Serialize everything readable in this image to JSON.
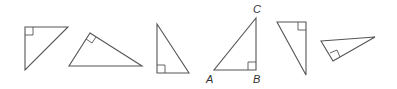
{
  "figure": {
    "triangles": [
      {
        "id": "triangle-1",
        "orientation": "right angle top-left",
        "labels": []
      },
      {
        "id": "triangle-2",
        "orientation": "right angle at apex, hypotenuse on bottom",
        "labels": []
      },
      {
        "id": "triangle-3",
        "orientation": "right angle bottom-left",
        "labels": []
      },
      {
        "id": "triangle-4",
        "orientation": "right angle bottom-right",
        "labels": [
          "A",
          "B",
          "C"
        ]
      },
      {
        "id": "triangle-5",
        "orientation": "right angle top-right",
        "labels": []
      },
      {
        "id": "triangle-6",
        "orientation": "right angle at bottom, rotated",
        "labels": []
      }
    ],
    "vertex_labels": {
      "a": "A",
      "b": "B",
      "c": "C"
    },
    "colors": {
      "stroke": "#555555",
      "label": "#333333"
    }
  }
}
